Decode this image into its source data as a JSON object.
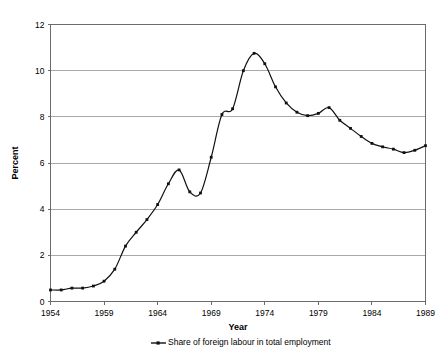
{
  "chart_data": {
    "type": "line",
    "title": "",
    "xlabel": "Year",
    "ylabel": "Percent",
    "xlim": [
      1954,
      1989
    ],
    "ylim": [
      0,
      12
    ],
    "x_tick_labels": [
      "1954",
      "1959",
      "1964",
      "1969",
      "1974",
      "1979",
      "1984",
      "1989"
    ],
    "x_ticks": [
      1954,
      1959,
      1964,
      1969,
      1974,
      1979,
      1984,
      1989
    ],
    "y_tick_labels": [
      "0",
      "2",
      "4",
      "6",
      "8",
      "10",
      "12"
    ],
    "y_ticks": [
      0,
      2,
      4,
      6,
      8,
      10,
      12
    ],
    "grid": "horizontal",
    "legend_position": "bottom",
    "x": [
      1954,
      1955,
      1956,
      1957,
      1958,
      1959,
      1960,
      1961,
      1962,
      1963,
      1964,
      1965,
      1966,
      1967,
      1968,
      1969,
      1970,
      1971,
      1972,
      1973,
      1974,
      1975,
      1976,
      1977,
      1978,
      1979,
      1980,
      1981,
      1982,
      1983,
      1984,
      1985,
      1986,
      1987,
      1988,
      1989
    ],
    "series": [
      {
        "name": "Share of foreign labour in total employment",
        "marker": "square",
        "color": "#111111",
        "values": [
          0.5,
          0.5,
          0.58,
          0.58,
          0.67,
          0.88,
          1.4,
          2.4,
          3.0,
          3.55,
          4.2,
          5.1,
          5.7,
          4.75,
          4.7,
          6.25,
          8.1,
          8.35,
          10.0,
          10.75,
          10.3,
          9.3,
          8.6,
          8.2,
          8.05,
          8.15,
          8.4,
          7.85,
          7.5,
          7.15,
          6.85,
          6.7,
          6.6,
          6.45,
          6.55,
          6.75
        ]
      }
    ]
  },
  "legend": {
    "entries": [
      {
        "label": "Share of foreign labour in total employment",
        "marker_icon": "line-marker-icon"
      }
    ]
  },
  "axes": {
    "y_title": "Percent",
    "x_title": "Year"
  },
  "colors": {
    "series": "#111111",
    "gridline": "#a8a8a8",
    "axis": "#6b6b6b",
    "background": "#ffffff"
  }
}
